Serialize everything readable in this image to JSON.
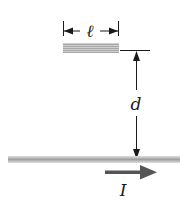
{
  "diagram": {
    "short_wire_length_label": "ℓ",
    "distance_label": "d",
    "current_label": "I",
    "colors": {
      "wire": "#b8b8b8",
      "wire_dark": "#9a9a9a",
      "line": "#1a1a1a",
      "current_arrow": "#555555"
    }
  }
}
